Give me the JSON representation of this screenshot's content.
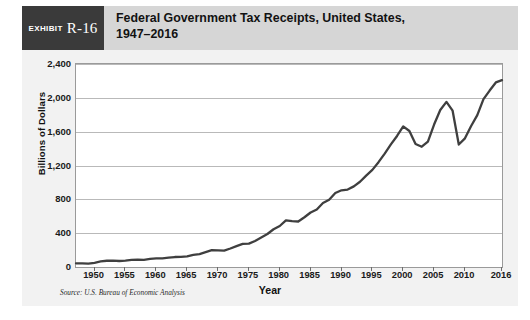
{
  "exhibit": {
    "tag_word": "Exhibit",
    "tag_number": "R-16",
    "title": "Federal Government Tax Receipts,  United States,\n1947–2016"
  },
  "source_note": "Source: U.S. Bureau of Economic Analysis",
  "colors": {
    "header_band": "#d6d6d6",
    "exhibit_tag": "#3a3a3a",
    "card_background": "#f2f2f2",
    "plot_background": "#ffffff",
    "gridline": "#b9b9b9",
    "series_line": "#3f3f3f",
    "text": "#111111"
  },
  "chart_data": {
    "type": "line",
    "title": "Federal Government Tax Receipts,  United States, 1947–2016",
    "xlabel": "Year",
    "ylabel": "Billions of Dollars",
    "xlim": [
      1947,
      2016
    ],
    "ylim": [
      0,
      2400
    ],
    "grid": true,
    "legend": "none",
    "yticks": [
      0,
      400,
      800,
      1200,
      1600,
      2000,
      2400
    ],
    "ytick_labels": [
      "0",
      "400",
      "800",
      "1,200",
      "1,600",
      "2,000",
      "2,400"
    ],
    "xticks": [
      1950,
      1955,
      1960,
      1965,
      1970,
      1975,
      1980,
      1985,
      1990,
      1995,
      2000,
      2005,
      2010,
      2016
    ],
    "xtick_labels": [
      "1950",
      "1955",
      "1960",
      "1965",
      "1970",
      "1975",
      "1980",
      "1985",
      "1990",
      "1995",
      "2000",
      "2005",
      "2010",
      "2016"
    ],
    "series": [
      {
        "name": "Federal Government Tax Receipts",
        "x": [
          1947,
          1948,
          1949,
          1950,
          1951,
          1952,
          1953,
          1954,
          1955,
          1956,
          1957,
          1958,
          1959,
          1960,
          1961,
          1962,
          1963,
          1964,
          1965,
          1966,
          1967,
          1968,
          1969,
          1970,
          1971,
          1972,
          1973,
          1974,
          1975,
          1976,
          1977,
          1978,
          1979,
          1980,
          1981,
          1982,
          1983,
          1984,
          1985,
          1986,
          1987,
          1988,
          1989,
          1990,
          1991,
          1992,
          1993,
          1994,
          1995,
          1996,
          1997,
          1998,
          1999,
          2000,
          2001,
          2002,
          2003,
          2004,
          2005,
          2006,
          2007,
          2008,
          2009,
          2010,
          2011,
          2012,
          2013,
          2014,
          2015,
          2016
        ],
        "y": [
          43,
          44,
          39,
          50,
          66,
          74,
          76,
          71,
          76,
          84,
          88,
          85,
          95,
          101,
          103,
          110,
          118,
          119,
          126,
          143,
          152,
          175,
          199,
          196,
          194,
          219,
          247,
          273,
          276,
          308,
          348,
          390,
          446,
          485,
          552,
          542,
          538,
          588,
          644,
          680,
          757,
          796,
          875,
          907,
          916,
          953,
          1008,
          1081,
          1148,
          1239,
          1341,
          1449,
          1549,
          1662,
          1608,
          1454,
          1422,
          1483,
          1684,
          1856,
          1952,
          1848,
          1448,
          1521,
          1667,
          1795,
          1985,
          2086,
          2182,
          2210
        ]
      }
    ],
    "annotations": []
  }
}
